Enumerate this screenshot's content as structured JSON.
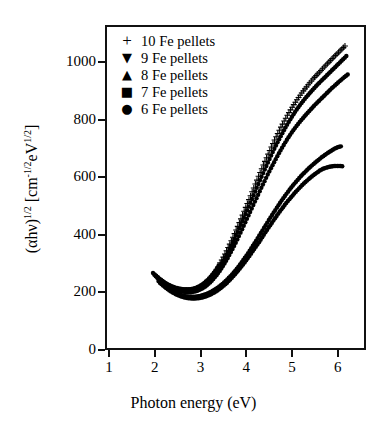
{
  "figure": {
    "xlabel": "Photon energy (eV)",
    "ylabel_parts": {
      "a": "(αhν)",
      "exp1": "1/2",
      "b": " [cm",
      "exp2": "-1/2",
      "c": "eV",
      "exp3": "1/2",
      "d": "]"
    }
  },
  "legend": {
    "entries": [
      {
        "marker": "+",
        "marker_name": "plus-marker",
        "label": "10 Fe pellets"
      },
      {
        "marker": "▼",
        "marker_name": "down-triangle-marker",
        "label": "9 Fe pellets"
      },
      {
        "marker": "▲",
        "marker_name": "up-triangle-marker",
        "label": "8 Fe pellets"
      },
      {
        "marker": "■",
        "marker_name": "square-marker",
        "label": "7 Fe pellets"
      },
      {
        "marker": "●",
        "marker_name": "circle-marker",
        "label": "6 Fe pellets"
      }
    ]
  },
  "chart_data": {
    "type": "scatter",
    "title": "",
    "xlabel": "Photon energy (eV)",
    "ylabel": "(αhν)^1/2 [cm^-1/2 eV^1/2]",
    "xlim": [
      0.91,
      6.62
    ],
    "ylim": [
      0,
      1130
    ],
    "xticks": [
      1,
      2,
      3,
      4,
      5,
      6
    ],
    "yticks": [
      0,
      200,
      400,
      600,
      800,
      1000
    ],
    "grid": false,
    "legend_position": "upper-left",
    "marker_size_px": 2.2,
    "series": [
      {
        "name": "10 Fe pellets",
        "marker": "+",
        "points": [
          [
            1.96,
            268
          ],
          [
            2.03,
            258
          ],
          [
            2.1,
            248
          ],
          [
            2.17,
            240
          ],
          [
            2.24,
            232
          ],
          [
            2.31,
            226
          ],
          [
            2.38,
            221
          ],
          [
            2.45,
            217
          ],
          [
            2.52,
            214
          ],
          [
            2.59,
            212
          ],
          [
            2.66,
            211
          ],
          [
            2.73,
            211
          ],
          [
            2.8,
            212
          ],
          [
            2.87,
            215
          ],
          [
            2.94,
            219
          ],
          [
            3.01,
            225
          ],
          [
            3.08,
            233
          ],
          [
            3.15,
            243
          ],
          [
            3.22,
            255
          ],
          [
            3.29,
            269
          ],
          [
            3.36,
            285
          ],
          [
            3.43,
            303
          ],
          [
            3.5,
            323
          ],
          [
            3.57,
            345
          ],
          [
            3.64,
            368
          ],
          [
            3.71,
            392
          ],
          [
            3.78,
            417
          ],
          [
            3.85,
            443
          ],
          [
            3.92,
            469
          ],
          [
            3.99,
            496
          ],
          [
            4.06,
            523
          ],
          [
            4.13,
            550
          ],
          [
            4.2,
            577
          ],
          [
            4.27,
            604
          ],
          [
            4.34,
            630
          ],
          [
            4.41,
            656
          ],
          [
            4.48,
            681
          ],
          [
            4.55,
            706
          ],
          [
            4.62,
            730
          ],
          [
            4.69,
            753
          ],
          [
            4.76,
            775
          ],
          [
            4.83,
            796
          ],
          [
            4.9,
            816
          ],
          [
            4.97,
            835
          ],
          [
            5.04,
            853
          ],
          [
            5.11,
            870
          ],
          [
            5.18,
            886
          ],
          [
            5.25,
            901
          ],
          [
            5.32,
            915
          ],
          [
            5.39,
            929
          ],
          [
            5.46,
            942
          ],
          [
            5.53,
            954
          ],
          [
            5.6,
            966
          ],
          [
            5.67,
            978
          ],
          [
            5.74,
            990
          ],
          [
            5.81,
            1001
          ],
          [
            5.88,
            1013
          ],
          [
            5.95,
            1024
          ],
          [
            6.02,
            1035
          ],
          [
            6.09,
            1046
          ],
          [
            6.16,
            1057
          ]
        ]
      },
      {
        "name": "9 Fe pellets",
        "marker": "▼",
        "points": [
          [
            1.99,
            262
          ],
          [
            2.06,
            252
          ],
          [
            2.13,
            243
          ],
          [
            2.2,
            235
          ],
          [
            2.27,
            228
          ],
          [
            2.34,
            222
          ],
          [
            2.41,
            217
          ],
          [
            2.48,
            213
          ],
          [
            2.55,
            210
          ],
          [
            2.62,
            208
          ],
          [
            2.69,
            207
          ],
          [
            2.76,
            207
          ],
          [
            2.83,
            209
          ],
          [
            2.9,
            212
          ],
          [
            2.97,
            217
          ],
          [
            3.04,
            223
          ],
          [
            3.11,
            231
          ],
          [
            3.18,
            241
          ],
          [
            3.25,
            253
          ],
          [
            3.32,
            267
          ],
          [
            3.39,
            283
          ],
          [
            3.46,
            301
          ],
          [
            3.53,
            320
          ],
          [
            3.6,
            341
          ],
          [
            3.67,
            363
          ],
          [
            3.74,
            386
          ],
          [
            3.81,
            410
          ],
          [
            3.88,
            435
          ],
          [
            3.95,
            460
          ],
          [
            4.02,
            486
          ],
          [
            4.09,
            512
          ],
          [
            4.16,
            538
          ],
          [
            4.23,
            564
          ],
          [
            4.3,
            590
          ],
          [
            4.37,
            615
          ],
          [
            4.44,
            640
          ],
          [
            4.51,
            664
          ],
          [
            4.58,
            688
          ],
          [
            4.65,
            711
          ],
          [
            4.72,
            733
          ],
          [
            4.79,
            754
          ],
          [
            4.86,
            774
          ],
          [
            4.93,
            793
          ],
          [
            5.0,
            811
          ],
          [
            5.07,
            828
          ],
          [
            5.14,
            844
          ],
          [
            5.21,
            859
          ],
          [
            5.28,
            873
          ],
          [
            5.35,
            886
          ],
          [
            5.42,
            899
          ],
          [
            5.49,
            911
          ],
          [
            5.56,
            923
          ],
          [
            5.63,
            934
          ],
          [
            5.7,
            945
          ],
          [
            5.77,
            956
          ],
          [
            5.84,
            967
          ],
          [
            5.91,
            978
          ],
          [
            5.98,
            989
          ],
          [
            6.05,
            1000
          ],
          [
            6.12,
            1011
          ],
          [
            6.19,
            1022
          ]
        ]
      },
      {
        "name": "8 Fe pellets",
        "marker": "▲",
        "points": [
          [
            2.02,
            256
          ],
          [
            2.09,
            246
          ],
          [
            2.16,
            237
          ],
          [
            2.23,
            229
          ],
          [
            2.3,
            222
          ],
          [
            2.37,
            216
          ],
          [
            2.44,
            211
          ],
          [
            2.51,
            207
          ],
          [
            2.58,
            204
          ],
          [
            2.65,
            202
          ],
          [
            2.72,
            201
          ],
          [
            2.79,
            201
          ],
          [
            2.86,
            203
          ],
          [
            2.93,
            206
          ],
          [
            3.0,
            211
          ],
          [
            3.07,
            217
          ],
          [
            3.14,
            225
          ],
          [
            3.21,
            235
          ],
          [
            3.28,
            247
          ],
          [
            3.35,
            260
          ],
          [
            3.42,
            275
          ],
          [
            3.49,
            292
          ],
          [
            3.56,
            310
          ],
          [
            3.63,
            330
          ],
          [
            3.7,
            351
          ],
          [
            3.77,
            373
          ],
          [
            3.84,
            396
          ],
          [
            3.91,
            420
          ],
          [
            3.98,
            444
          ],
          [
            4.05,
            468
          ],
          [
            4.12,
            492
          ],
          [
            4.19,
            516
          ],
          [
            4.26,
            540
          ],
          [
            4.33,
            564
          ],
          [
            4.4,
            587
          ],
          [
            4.47,
            610
          ],
          [
            4.54,
            632
          ],
          [
            4.61,
            653
          ],
          [
            4.68,
            674
          ],
          [
            4.75,
            694
          ],
          [
            4.82,
            713
          ],
          [
            4.89,
            731
          ],
          [
            4.96,
            748
          ],
          [
            5.03,
            764
          ],
          [
            5.1,
            779
          ],
          [
            5.17,
            793
          ],
          [
            5.24,
            806
          ],
          [
            5.31,
            819
          ],
          [
            5.38,
            831
          ],
          [
            5.45,
            843
          ],
          [
            5.52,
            855
          ],
          [
            5.59,
            866
          ],
          [
            5.66,
            877
          ],
          [
            5.73,
            888
          ],
          [
            5.8,
            899
          ],
          [
            5.87,
            910
          ],
          [
            5.94,
            920
          ],
          [
            6.01,
            930
          ],
          [
            6.08,
            940
          ],
          [
            6.15,
            949
          ],
          [
            6.22,
            958
          ]
        ]
      },
      {
        "name": "7 Fe pellets",
        "marker": "■",
        "points": [
          [
            2.08,
            240
          ],
          [
            2.15,
            230
          ],
          [
            2.22,
            221
          ],
          [
            2.29,
            213
          ],
          [
            2.36,
            206
          ],
          [
            2.43,
            200
          ],
          [
            2.5,
            195
          ],
          [
            2.57,
            191
          ],
          [
            2.64,
            188
          ],
          [
            2.71,
            186
          ],
          [
            2.78,
            185
          ],
          [
            2.85,
            185
          ],
          [
            2.92,
            186
          ],
          [
            2.99,
            188
          ],
          [
            3.06,
            191
          ],
          [
            3.13,
            195
          ],
          [
            3.2,
            200
          ],
          [
            3.27,
            206
          ],
          [
            3.34,
            213
          ],
          [
            3.41,
            221
          ],
          [
            3.48,
            230
          ],
          [
            3.55,
            240
          ],
          [
            3.62,
            251
          ],
          [
            3.69,
            263
          ],
          [
            3.76,
            276
          ],
          [
            3.83,
            290
          ],
          [
            3.9,
            305
          ],
          [
            3.97,
            321
          ],
          [
            4.04,
            337
          ],
          [
            4.11,
            354
          ],
          [
            4.18,
            371
          ],
          [
            4.25,
            389
          ],
          [
            4.32,
            407
          ],
          [
            4.39,
            425
          ],
          [
            4.46,
            443
          ],
          [
            4.53,
            461
          ],
          [
            4.6,
            478
          ],
          [
            4.67,
            495
          ],
          [
            4.74,
            512
          ],
          [
            4.81,
            528
          ],
          [
            4.88,
            543
          ],
          [
            4.95,
            558
          ],
          [
            5.02,
            572
          ],
          [
            5.09,
            585
          ],
          [
            5.16,
            598
          ],
          [
            5.23,
            610
          ],
          [
            5.3,
            621
          ],
          [
            5.37,
            632
          ],
          [
            5.44,
            642
          ],
          [
            5.51,
            652
          ],
          [
            5.58,
            661
          ],
          [
            5.65,
            670
          ],
          [
            5.72,
            678
          ],
          [
            5.79,
            686
          ],
          [
            5.86,
            693
          ],
          [
            5.93,
            700
          ],
          [
            6.0,
            705
          ],
          [
            6.07,
            708
          ]
        ]
      },
      {
        "name": "6 Fe pellets",
        "marker": "●",
        "points": [
          [
            2.11,
            234
          ],
          [
            2.18,
            224
          ],
          [
            2.25,
            215
          ],
          [
            2.32,
            207
          ],
          [
            2.39,
            200
          ],
          [
            2.46,
            194
          ],
          [
            2.53,
            189
          ],
          [
            2.6,
            185
          ],
          [
            2.67,
            182
          ],
          [
            2.74,
            180
          ],
          [
            2.81,
            179
          ],
          [
            2.88,
            179
          ],
          [
            2.95,
            180
          ],
          [
            3.02,
            182
          ],
          [
            3.09,
            185
          ],
          [
            3.16,
            189
          ],
          [
            3.23,
            194
          ],
          [
            3.3,
            200
          ],
          [
            3.37,
            207
          ],
          [
            3.44,
            215
          ],
          [
            3.51,
            224
          ],
          [
            3.58,
            234
          ],
          [
            3.65,
            245
          ],
          [
            3.72,
            257
          ],
          [
            3.79,
            270
          ],
          [
            3.86,
            283
          ],
          [
            3.93,
            297
          ],
          [
            4.0,
            312
          ],
          [
            4.07,
            327
          ],
          [
            4.14,
            343
          ],
          [
            4.21,
            359
          ],
          [
            4.28,
            375
          ],
          [
            4.35,
            392
          ],
          [
            4.42,
            409
          ],
          [
            4.49,
            426
          ],
          [
            4.56,
            442
          ],
          [
            4.63,
            458
          ],
          [
            4.7,
            474
          ],
          [
            4.77,
            489
          ],
          [
            4.84,
            504
          ],
          [
            4.91,
            518
          ],
          [
            4.98,
            531
          ],
          [
            5.05,
            544
          ],
          [
            5.12,
            556
          ],
          [
            5.19,
            568
          ],
          [
            5.26,
            579
          ],
          [
            5.33,
            589
          ],
          [
            5.4,
            599
          ],
          [
            5.47,
            608
          ],
          [
            5.54,
            616
          ],
          [
            5.61,
            624
          ],
          [
            5.68,
            630
          ],
          [
            5.75,
            634
          ],
          [
            5.82,
            637
          ],
          [
            5.89,
            639
          ],
          [
            5.96,
            640
          ],
          [
            6.03,
            640
          ],
          [
            6.1,
            639
          ]
        ]
      }
    ]
  }
}
